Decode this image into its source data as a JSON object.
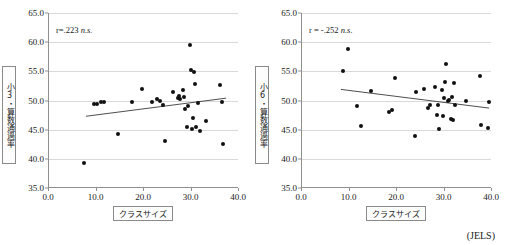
{
  "figure": {
    "source_note": "(JELS)",
    "background": "#ffffff",
    "point_color": "#111111",
    "fit_line_color": "#3a3a3a",
    "grid_color": "#d9d9d9",
    "axis_color": "#8f8f8f"
  },
  "panels": [
    {
      "id": "left",
      "annotation_prefix": "r=.223",
      "annotation_suffix": "n.s.",
      "y_axis_title": "小3・算数通過率",
      "x_axis_title": "クラスサイズ",
      "chart_data": {
        "type": "scatter",
        "title": "",
        "xlabel": "クラスサイズ",
        "ylabel": "小3・算数通過率",
        "xlim": [
          0.0,
          40.0
        ],
        "ylim": [
          35.0,
          65.0
        ],
        "xticks": [
          "0.0",
          "10.0",
          "20.0",
          "30.0",
          "40.0"
        ],
        "yticks": [
          "35.0",
          "40.0",
          "45.0",
          "50.0",
          "55.0",
          "60.0",
          "65.0"
        ],
        "xtick_values": [
          0.0,
          10.0,
          20.0,
          30.0,
          40.0
        ],
        "ytick_values": [
          35.0,
          40.0,
          45.0,
          50.0,
          55.0,
          60.0,
          65.0
        ],
        "grid": "horizontal",
        "legend": "none",
        "annotation": "r=.223 n.s.",
        "correlation_r": 0.223,
        "significance": "n.s.",
        "points": [
          [
            7.6,
            39.3
          ],
          [
            9.7,
            49.4
          ],
          [
            10.4,
            49.4
          ],
          [
            11.2,
            49.8
          ],
          [
            11.7,
            49.8
          ],
          [
            14.7,
            44.2
          ],
          [
            17.6,
            49.8
          ],
          [
            19.7,
            51.9
          ],
          [
            21.9,
            49.8
          ],
          [
            23.0,
            50.3
          ],
          [
            23.5,
            49.9
          ],
          [
            24.2,
            49.2
          ],
          [
            24.6,
            43.1
          ],
          [
            26.3,
            51.4
          ],
          [
            27.3,
            50.4
          ],
          [
            27.6,
            50.7
          ],
          [
            27.8,
            50.2
          ],
          [
            28.4,
            51.8
          ],
          [
            28.6,
            50.6
          ],
          [
            28.8,
            48.6
          ],
          [
            29.2,
            45.5
          ],
          [
            29.4,
            49.0
          ],
          [
            29.9,
            59.5
          ],
          [
            30.2,
            55.2
          ],
          [
            30.4,
            45.2
          ],
          [
            30.5,
            47.0
          ],
          [
            30.8,
            54.9
          ],
          [
            31.0,
            52.9
          ],
          [
            31.2,
            45.4
          ],
          [
            31.6,
            49.6
          ],
          [
            32.0,
            44.7
          ],
          [
            33.2,
            46.5
          ],
          [
            36.3,
            52.6
          ],
          [
            36.6,
            49.7
          ],
          [
            36.9,
            42.6
          ]
        ],
        "fit_line": {
          "x0": 8.0,
          "y0": 47.3,
          "x1": 37.5,
          "y1": 50.4
        }
      }
    },
    {
      "id": "right",
      "annotation_prefix": "r = -.252",
      "annotation_suffix": "n.s.",
      "y_axis_title": "小6・算数通過率",
      "x_axis_title": "クラスサイズ",
      "chart_data": {
        "type": "scatter",
        "title": "",
        "xlabel": "クラスサイズ",
        "ylabel": "小6・算数通過率",
        "xlim": [
          0.0,
          40.0
        ],
        "ylim": [
          35.0,
          65.0
        ],
        "xticks": [
          "0.0",
          "10.0",
          "20.0",
          "30.0",
          "40.0"
        ],
        "yticks": [
          "35.0",
          "40.0",
          "45.0",
          "50.0",
          "55.0",
          "60.0",
          "65.0"
        ],
        "xtick_values": [
          0.0,
          10.0,
          20.0,
          30.0,
          40.0
        ],
        "ytick_values": [
          35.0,
          40.0,
          45.0,
          50.0,
          55.0,
          60.0,
          65.0
        ],
        "grid": "horizontal",
        "legend": "none",
        "annotation": "r = -.252 n.s.",
        "correlation_r": -0.252,
        "significance": "n.s.",
        "points": [
          [
            8.8,
            55.1
          ],
          [
            9.8,
            58.9
          ],
          [
            11.8,
            49.0
          ],
          [
            12.6,
            45.6
          ],
          [
            14.8,
            51.6
          ],
          [
            18.6,
            48.0
          ],
          [
            19.2,
            48.3
          ],
          [
            19.8,
            53.9
          ],
          [
            24.1,
            43.9
          ],
          [
            24.3,
            51.4
          ],
          [
            25.9,
            52.0
          ],
          [
            26.8,
            48.7
          ],
          [
            27.1,
            49.3
          ],
          [
            28.2,
            52.4
          ],
          [
            28.6,
            47.5
          ],
          [
            28.9,
            49.3
          ],
          [
            29.0,
            45.2
          ],
          [
            29.6,
            51.8
          ],
          [
            29.9,
            47.4
          ],
          [
            30.2,
            50.4
          ],
          [
            30.4,
            53.2
          ],
          [
            30.6,
            56.2
          ],
          [
            30.9,
            49.9
          ],
          [
            31.2,
            50.1
          ],
          [
            31.5,
            46.8
          ],
          [
            31.8,
            50.6
          ],
          [
            32.0,
            46.7
          ],
          [
            32.2,
            53.0
          ],
          [
            32.4,
            49.2
          ],
          [
            34.8,
            49.9
          ],
          [
            37.7,
            54.2
          ],
          [
            37.8,
            45.8
          ],
          [
            39.3,
            45.3
          ],
          [
            39.5,
            49.7
          ]
        ],
        "fit_line": {
          "x0": 8.4,
          "y0": 51.9,
          "x1": 39.6,
          "y1": 48.7
        }
      }
    }
  ]
}
